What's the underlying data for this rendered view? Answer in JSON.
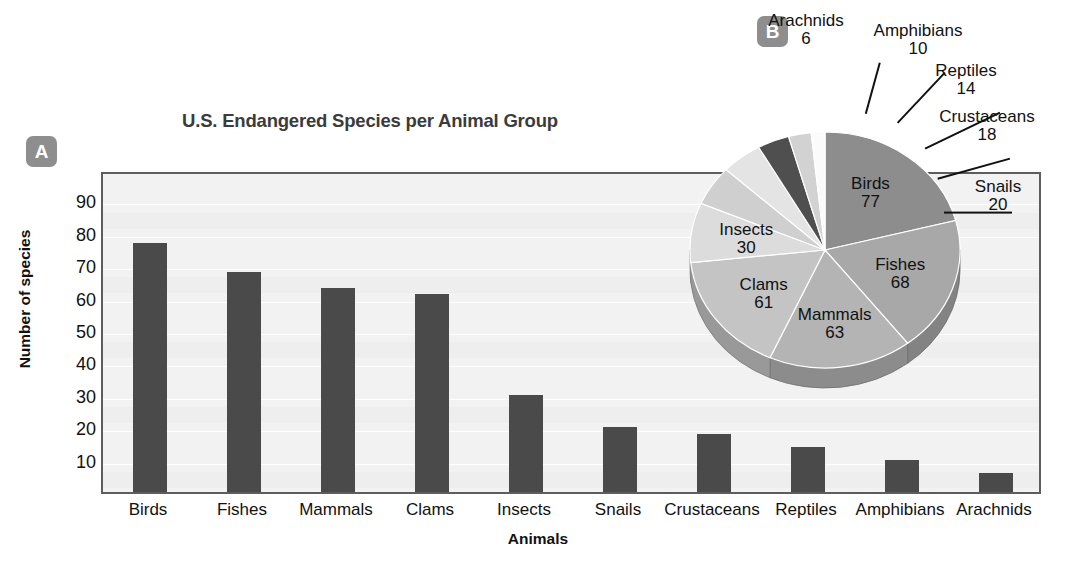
{
  "panels": {
    "a_badge": "A",
    "b_badge": "B"
  },
  "bar_chart": {
    "title": "U.S. Endangered Species per Animal Group",
    "xlabel": "Animals",
    "ylabel": "Number of species",
    "yticks": [
      "90",
      "80",
      "70",
      "60",
      "50",
      "40",
      "30",
      "20",
      "10"
    ],
    "bar_color": "#4a4a4a",
    "plot_bg": "#f2f2f2"
  },
  "chart_data": [
    {
      "type": "bar",
      "title": "U.S. Endangered Species per Animal Group",
      "xlabel": "Animals",
      "ylabel": "Number of species",
      "categories": [
        "Birds",
        "Fishes",
        "Mammals",
        "Clams",
        "Insects",
        "Snails",
        "Crustaceans",
        "Reptiles",
        "Amphibians",
        "Arachnids"
      ],
      "values": [
        77,
        68,
        63,
        61,
        30,
        20,
        18,
        14,
        10,
        6
      ],
      "ylim": [
        0,
        95
      ],
      "ytick_values": [
        10,
        20,
        30,
        40,
        50,
        60,
        70,
        80,
        90
      ],
      "grid": true,
      "legend": "none"
    },
    {
      "type": "pie",
      "title": "",
      "labels": [
        "Birds",
        "Fishes",
        "Mammals",
        "Clams",
        "Insects",
        "Snails",
        "Crustaceans",
        "Reptiles",
        "Amphibians",
        "Arachnids"
      ],
      "values": [
        77,
        68,
        63,
        61,
        30,
        20,
        18,
        14,
        10,
        6
      ],
      "total": 367,
      "three_d": true,
      "legend": "none",
      "slice_colors": [
        "#8d8d8d",
        "#a8a8a8",
        "#b4b4b4",
        "#c4c4c4",
        "#dcdcdc",
        "#cfcfcf",
        "#e4e4e4",
        "#4f4f4f",
        "#d2d2d2",
        "#fbfbfb"
      ]
    }
  ],
  "pie_labels_inside": [
    {
      "name": "Birds",
      "value": "77"
    },
    {
      "name": "Fishes",
      "value": "68"
    },
    {
      "name": "Mammals",
      "value": "63"
    },
    {
      "name": "Clams",
      "value": "61"
    },
    {
      "name": "Insects",
      "value": "30"
    }
  ],
  "pie_labels_outside": [
    {
      "name": "Arachnids",
      "value": "6"
    },
    {
      "name": "Amphibians",
      "value": "10"
    },
    {
      "name": "Reptiles",
      "value": "14"
    },
    {
      "name": "Crustaceans",
      "value": "18"
    },
    {
      "name": "Snails",
      "value": "20"
    }
  ]
}
